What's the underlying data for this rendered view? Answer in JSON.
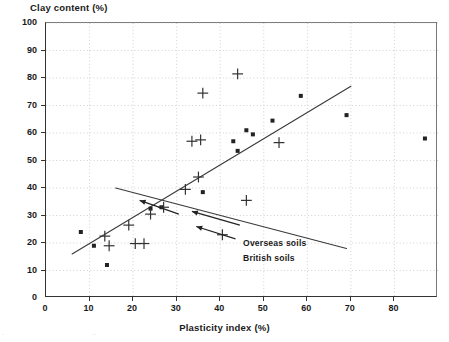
{
  "chart_data": {
    "type": "scatter",
    "title": "",
    "xlabel": "Plasticity index (%)",
    "ylabel": "Clay content (%)",
    "xlim": [
      0,
      90
    ],
    "ylim": [
      0,
      100
    ],
    "xticks": [
      0,
      10,
      20,
      30,
      40,
      50,
      60,
      70,
      80
    ],
    "yticks": [
      0,
      10,
      20,
      30,
      40,
      50,
      60,
      70,
      80,
      90,
      100
    ],
    "grid": true,
    "legend_position": "inline-annotations",
    "series": [
      {
        "name": "British soils",
        "marker": "square",
        "color": "#222222",
        "points": [
          [
            8,
            24
          ],
          [
            11,
            19
          ],
          [
            14,
            12
          ],
          [
            24,
            32.5
          ],
          [
            26.5,
            33
          ],
          [
            36,
            38.5
          ],
          [
            43,
            57
          ],
          [
            44,
            53.5
          ],
          [
            46,
            61
          ],
          [
            47.5,
            59.5
          ],
          [
            52,
            64.5
          ],
          [
            58.5,
            73.5
          ],
          [
            69,
            66.5
          ],
          [
            87,
            58
          ]
        ]
      },
      {
        "name": "Overseas soils",
        "marker": "plus",
        "color": "#333333",
        "points": [
          [
            13.5,
            22.5
          ],
          [
            14.5,
            19
          ],
          [
            19,
            26.5
          ],
          [
            20.5,
            19.8
          ],
          [
            22.5,
            19.8
          ],
          [
            24,
            30.5
          ],
          [
            27,
            33
          ],
          [
            32,
            39.5
          ],
          [
            33.5,
            57
          ],
          [
            35,
            44
          ],
          [
            35.5,
            57.5
          ],
          [
            36,
            74.5
          ],
          [
            40.5,
            23
          ],
          [
            44,
            81.5
          ],
          [
            46,
            35.5
          ],
          [
            53.5,
            56.5
          ]
        ]
      }
    ],
    "trend_lines": [
      {
        "name": "Overseas soils trend",
        "direction": "rising",
        "x_start": 6,
        "y_start": 16,
        "x_end": 70,
        "y_end": 77
      },
      {
        "name": "British soils trend",
        "direction": "falling",
        "x_start": 16,
        "y_start": 40,
        "x_end": 69,
        "y_end": 18
      }
    ],
    "annotations": [
      {
        "label": "Overseas soils",
        "points_to": "rising-trend-line"
      },
      {
        "label": "British soils",
        "points_to": "falling-trend-line"
      }
    ]
  },
  "axes": {
    "y_title": "Clay content (%)",
    "x_title": "Plasticity index (%)",
    "y_labels": [
      "0",
      "10",
      "20",
      "30",
      "40",
      "50",
      "60",
      "70",
      "80",
      "90",
      "100"
    ],
    "x_labels": [
      "0",
      "10",
      "20",
      "30",
      "40",
      "50",
      "60",
      "70",
      "80"
    ]
  },
  "annotations": {
    "overseas": "Overseas soils",
    "british": "British soils"
  },
  "colors": {
    "axis": "#333333",
    "grid": "#bdbdbd",
    "marker": "#222222",
    "trend": "#3a3a3a"
  }
}
